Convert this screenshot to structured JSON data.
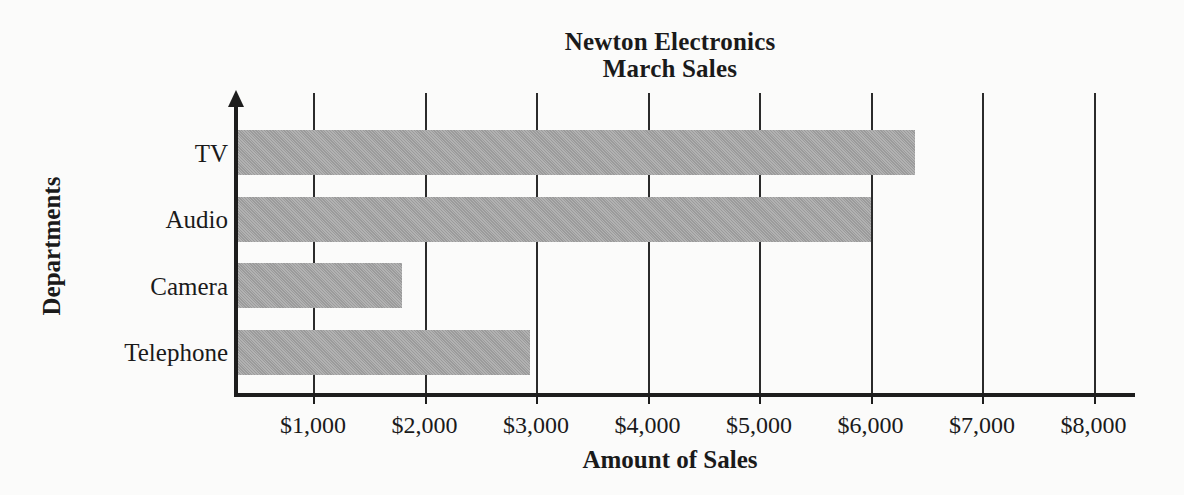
{
  "chart_data": {
    "type": "bar",
    "orientation": "horizontal",
    "title": "Newton Electronics",
    "subtitle": "March Sales",
    "categories": [
      "TV",
      "Audio",
      "Camera",
      "Telephone"
    ],
    "values": [
      6400,
      6000,
      1800,
      2950
    ],
    "xlabel": "Amount of Sales",
    "ylabel": "Departments",
    "xlim": [
      0,
      8300
    ],
    "xticks": [
      1000,
      2000,
      3000,
      4000,
      5000,
      6000,
      7000,
      8000
    ],
    "xtick_labels": [
      "$1,000",
      "$2,000",
      "$3,000",
      "$4,000",
      "$5,000",
      "$6,000",
      "$7,000",
      "$8,000"
    ],
    "grid": "vertical",
    "legend": "none",
    "bar_color": "#a3a3a3",
    "axis_color": "#1d1d1d",
    "background_color": "#fbfbfa"
  },
  "bars": [
    {
      "label": "TV",
      "value": 6400,
      "value_label": "$6,400"
    },
    {
      "label": "Audio",
      "value": 6000,
      "value_label": "$6,000"
    },
    {
      "label": "Camera",
      "value": 1800,
      "value_label": "$1,800"
    },
    {
      "label": "Telephone",
      "value": 2950,
      "value_label": "$2,950"
    }
  ]
}
